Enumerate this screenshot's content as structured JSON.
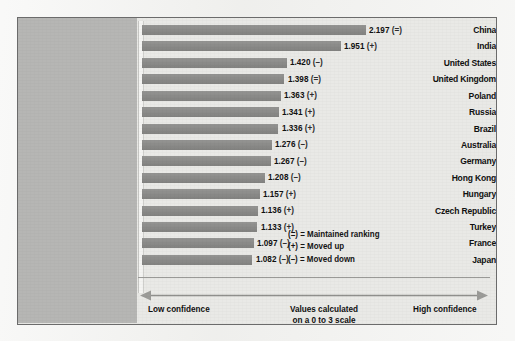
{
  "chart_data": {
    "type": "bar",
    "orientation": "horizontal",
    "title": "",
    "xlabel": "",
    "ylabel": "",
    "xlim": [
      0,
      3
    ],
    "grid": false,
    "scale_note": "Values calculated on a 0 to 3 scale",
    "categories": [
      "China",
      "India",
      "United States",
      "United Kingdom",
      "Poland",
      "Russia",
      "Brazil",
      "Australia",
      "Germany",
      "Hong Kong",
      "Hungary",
      "Czech Republic",
      "Turkey",
      "France",
      "Japan"
    ],
    "values": [
      2.197,
      1.951,
      1.42,
      1.398,
      1.363,
      1.341,
      1.336,
      1.276,
      1.267,
      1.208,
      1.157,
      1.136,
      1.133,
      1.097,
      1.082
    ],
    "value_labels": [
      "2.197",
      "1.951",
      "1.420",
      "1.398",
      "1.363",
      "1.341",
      "1.336",
      "1.276",
      "1.267",
      "1.208",
      "1.157",
      "1.136",
      "1.133",
      "1.097",
      "1.082"
    ],
    "trend_markers": [
      "(=)",
      "(+)",
      "(–)",
      "(=)",
      "(+)",
      "(+)",
      "(+)",
      "(–)",
      "(–)",
      "(–)",
      "(+)",
      "(+)",
      "(+)",
      "(–)",
      "(–)"
    ],
    "bar_color": "#8d8d8b",
    "panel_color": "#b6b6b4",
    "plot_background": "#e9e9e6"
  },
  "legend": {
    "items": [
      "(=) = Maintained ranking",
      "(+) = Moved up",
      "(–) = Moved down"
    ]
  },
  "axis": {
    "low_label": "Low confidence",
    "high_label": "High confidence",
    "mid_label_line1": "Values calculated",
    "mid_label_line2": "on a 0 to 3 scale",
    "mid_label": "Values calculated on a 0 to 3 scale"
  }
}
